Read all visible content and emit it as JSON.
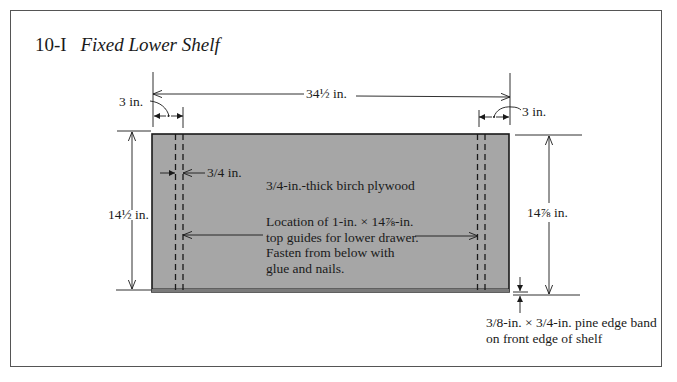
{
  "figure": {
    "number": "10-I",
    "title": "Fixed Lower Shelf"
  },
  "dimensions": {
    "overall_width": "34½ in.",
    "left_offset": "3 in.",
    "right_offset": "3 in.",
    "guide_width": "3/4 in.",
    "overall_depth": "14½ in.",
    "guide_length": "14⅞ in."
  },
  "notes": {
    "material": "3/4-in.-thick birch plywood",
    "guides": [
      "Location of 1-in. × 14⅞-in.",
      "top guides for lower drawer.",
      "Fasten from below with",
      "glue and nails."
    ],
    "edge_band": [
      "3/8-in. × 3/4-in. pine edge band",
      "on front edge of shelf"
    ]
  },
  "colors": {
    "shelf_fill": "#a6a6a6",
    "line": "#1a1a1a",
    "background": "#ffffff"
  }
}
